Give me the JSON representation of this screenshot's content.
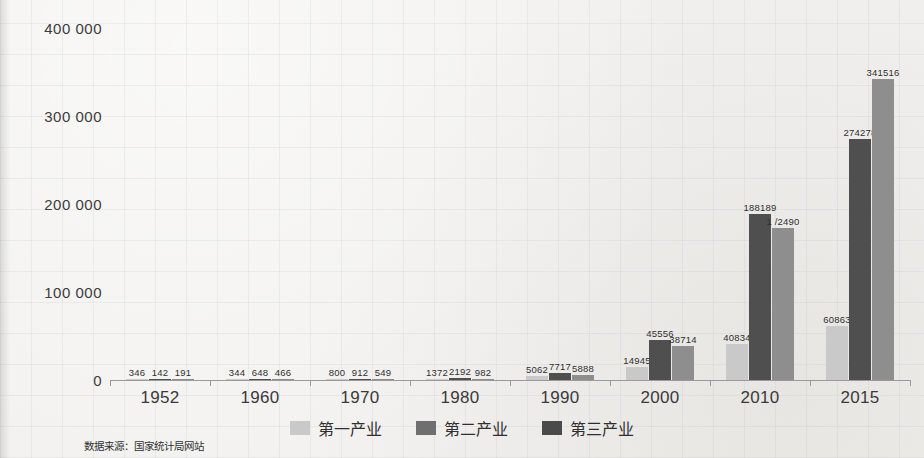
{
  "chart_data": {
    "type": "bar",
    "title": "",
    "xlabel": "",
    "ylabel": "",
    "categories": [
      "1952",
      "1960",
      "1970",
      "1980",
      "1990",
      "2000",
      "2010",
      "2015"
    ],
    "ylim": [
      0,
      400000
    ],
    "yticks": [
      0,
      100000,
      200000,
      300000,
      400000
    ],
    "ytick_labels": [
      "0",
      "100 000",
      "200 000",
      "300 000",
      "400 000"
    ],
    "grid": false,
    "legend_position": "bottom",
    "series": [
      {
        "name": "第一产业",
        "color": "#c9c9c9",
        "values": [
          346,
          344,
          800,
          1372,
          5062,
          14945,
          40834,
          60863
        ],
        "labels": [
          "346",
          "344",
          "800",
          "1372",
          "5062",
          "14945",
          "40834",
          "60863"
        ]
      },
      {
        "name": "第二产业",
        "color": "#4f4f4f",
        "values": [
          142,
          648,
          912,
          2192,
          7717,
          45556,
          188189,
          274278
        ],
        "labels": [
          "142",
          "648",
          "912",
          "2192",
          "7717",
          "45556",
          "188189",
          "274278"
        ]
      },
      {
        "name": "第三产业",
        "color": "#8e8e8e",
        "values": [
          191,
          466,
          549,
          982,
          5888,
          38714,
          172490,
          341516
        ],
        "labels": [
          "191",
          "466",
          "549",
          "982",
          "5888",
          "38714",
          "1 /2490",
          "341516"
        ]
      }
    ]
  },
  "legend": {
    "items": [
      {
        "label": "第一产业"
      },
      {
        "label": "第二产业"
      },
      {
        "label": "第三产业"
      }
    ]
  },
  "source_note": "数据来源：国家统计局网站"
}
